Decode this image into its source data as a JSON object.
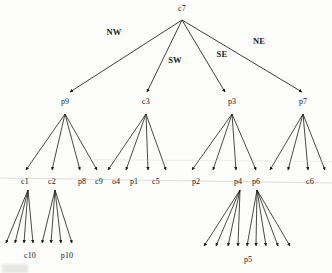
{
  "figure": {
    "type": "tree-diagram",
    "title": "",
    "background_color": "#fdfdfc",
    "stroke_color": "#1a1a1a"
  },
  "nodes": {
    "root": {
      "id": "c7",
      "label": "c7",
      "x": 182,
      "y": 10
    },
    "level1": [
      {
        "id": "p9",
        "label": "p9",
        "x": 65,
        "y": 104
      },
      {
        "id": "c3",
        "label": "c3",
        "x": 146,
        "y": 104
      },
      {
        "id": "p3",
        "label": "p3",
        "x": 232,
        "y": 104
      },
      {
        "id": "p7",
        "label": "p7",
        "x": 303,
        "y": 104
      }
    ],
    "level2": [
      {
        "id": "c1",
        "label": "c1",
        "x": 25,
        "y": 184
      },
      {
        "id": "c2",
        "label": "c2",
        "x": 52,
        "y": 184
      },
      {
        "id": "p8",
        "label": "p8",
        "x": 82,
        "y": 184
      },
      {
        "id": "c9",
        "label": "c9",
        "x": 99,
        "y": 184
      },
      {
        "id": "o4",
        "label": "o4",
        "x": 116,
        "y": 184
      },
      {
        "id": "p1",
        "label": "p1",
        "x": 134,
        "y": 184
      },
      {
        "id": "c5",
        "label": "c5",
        "x": 156,
        "y": 184
      },
      {
        "id": "p2",
        "label": "p2",
        "x": 196,
        "y": 184
      },
      {
        "id": "p4",
        "label": "p4",
        "x": 238,
        "y": 184
      },
      {
        "id": "p6",
        "label": "p6",
        "x": 256,
        "y": 184
      },
      {
        "id": "c6",
        "label": "c6",
        "x": 310,
        "y": 184
      }
    ],
    "level3": [
      {
        "id": "c10",
        "label": "c10",
        "x": 30,
        "y": 258
      },
      {
        "id": "p10",
        "label": "p10",
        "x": 67,
        "y": 258
      },
      {
        "id": "p5",
        "label": "p5",
        "x": 248,
        "y": 262
      }
    ]
  },
  "edge_labels": [
    {
      "id": "nw",
      "label": "NW",
      "x": 114,
      "y": 32
    },
    {
      "id": "sw",
      "label": "SW",
      "x": 175,
      "y": 60
    },
    {
      "id": "se",
      "label": "SE",
      "x": 222,
      "y": 54
    },
    {
      "id": "ne",
      "label": "NE",
      "x": 259,
      "y": 41
    }
  ],
  "edges": {
    "root_to_level1": [
      {
        "from": "c7",
        "to": "p9",
        "label": "NW"
      },
      {
        "from": "c7",
        "to": "c3",
        "label": "SW"
      },
      {
        "from": "c7",
        "to": "p3",
        "label": "SE"
      },
      {
        "from": "c7",
        "to": "p7",
        "label": "NE"
      }
    ],
    "level1_to_level2": [
      {
        "from": "p9",
        "count": 4
      },
      {
        "from": "c3",
        "count": 4
      },
      {
        "from": "p3",
        "count": 4
      },
      {
        "from": "p7",
        "count": 4
      }
    ],
    "level2_to_level3": [
      {
        "from": "c1",
        "count": 4
      },
      {
        "from": "c2",
        "count": 4
      },
      {
        "from": "p4",
        "count": 4
      },
      {
        "from": "p6",
        "count": 5
      }
    ]
  }
}
